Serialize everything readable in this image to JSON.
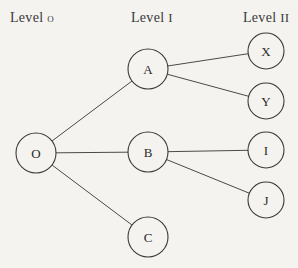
{
  "levels": [
    {
      "label": "Level",
      "num": "o",
      "x": 10
    },
    {
      "label": "Level",
      "num": "I",
      "x": 131
    },
    {
      "label": "Level",
      "num": "II",
      "x": 243
    }
  ],
  "nodes": [
    {
      "id": "O",
      "label": "O",
      "cx": 36,
      "cy": 153,
      "r": 20
    },
    {
      "id": "A",
      "label": "A",
      "cx": 148,
      "cy": 69,
      "r": 20
    },
    {
      "id": "B",
      "label": "B",
      "cx": 148,
      "cy": 152,
      "r": 20
    },
    {
      "id": "C",
      "label": "C",
      "cx": 148,
      "cy": 237,
      "r": 20
    },
    {
      "id": "X",
      "label": "X",
      "cx": 266,
      "cy": 51,
      "r": 18
    },
    {
      "id": "Y",
      "label": "Y",
      "cx": 266,
      "cy": 101,
      "r": 18
    },
    {
      "id": "I",
      "label": "I",
      "cx": 266,
      "cy": 150,
      "r": 18
    },
    {
      "id": "J",
      "label": "J",
      "cx": 266,
      "cy": 200,
      "r": 18
    }
  ],
  "edges": [
    {
      "from": "O",
      "to": "A"
    },
    {
      "from": "O",
      "to": "B"
    },
    {
      "from": "O",
      "to": "C"
    },
    {
      "from": "A",
      "to": "X"
    },
    {
      "from": "A",
      "to": "Y"
    },
    {
      "from": "B",
      "to": "I"
    },
    {
      "from": "B",
      "to": "J"
    }
  ]
}
